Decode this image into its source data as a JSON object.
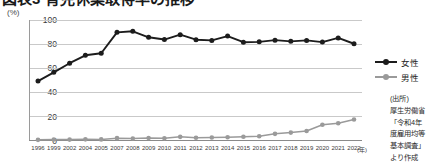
{
  "title": {
    "bullet": "bullet-icon",
    "text": "図表3 育児休業取得率の推移"
  },
  "axes": {
    "y_unit": "(%)",
    "y_ticks": [
      "100",
      "80",
      "60",
      "40",
      "20",
      "0"
    ],
    "x_unit": "(年)"
  },
  "legend": {
    "items": [
      {
        "label": "女性",
        "color": "#1c1c1c"
      },
      {
        "label": "男性",
        "color": "#9a9a9a"
      }
    ]
  },
  "source": {
    "lines": [
      "(出所)",
      "厚生労働省",
      "「令和4年",
      "度雇用均等",
      "基本調査」",
      "より作成"
    ]
  },
  "chart_data": {
    "type": "line",
    "title": "図表3 育児休業取得率の推移",
    "xlabel": "(年)",
    "ylabel": "(%)",
    "ylim": [
      0,
      100
    ],
    "yticks": [
      0,
      20,
      40,
      60,
      80,
      100
    ],
    "grid": true,
    "legend_position": "right",
    "categories": [
      "1996",
      "1999",
      "2002",
      "2004",
      "2005",
      "2007",
      "2008",
      "2009",
      "2010",
      "2011",
      "2012",
      "2013",
      "2014",
      "2015",
      "2016",
      "2017",
      "2018",
      "2019",
      "2020",
      "2021",
      "2022"
    ],
    "series": [
      {
        "name": "女性",
        "color": "#1c1c1c",
        "marker": "circle",
        "values": [
          49.1,
          56.4,
          64.0,
          70.6,
          72.3,
          89.7,
          90.6,
          85.6,
          83.7,
          87.8,
          83.6,
          83.0,
          86.6,
          81.5,
          81.8,
          83.2,
          82.2,
          83.0,
          81.6,
          85.1,
          80.2
        ]
      },
      {
        "name": "男性",
        "color": "#9a9a9a",
        "marker": "circle",
        "values": [
          0.12,
          0.42,
          0.33,
          0.56,
          0.5,
          1.56,
          1.23,
          1.72,
          1.38,
          2.63,
          1.89,
          2.03,
          2.3,
          2.65,
          3.16,
          5.14,
          6.16,
          7.48,
          12.65,
          13.97,
          17.13
        ]
      }
    ]
  }
}
